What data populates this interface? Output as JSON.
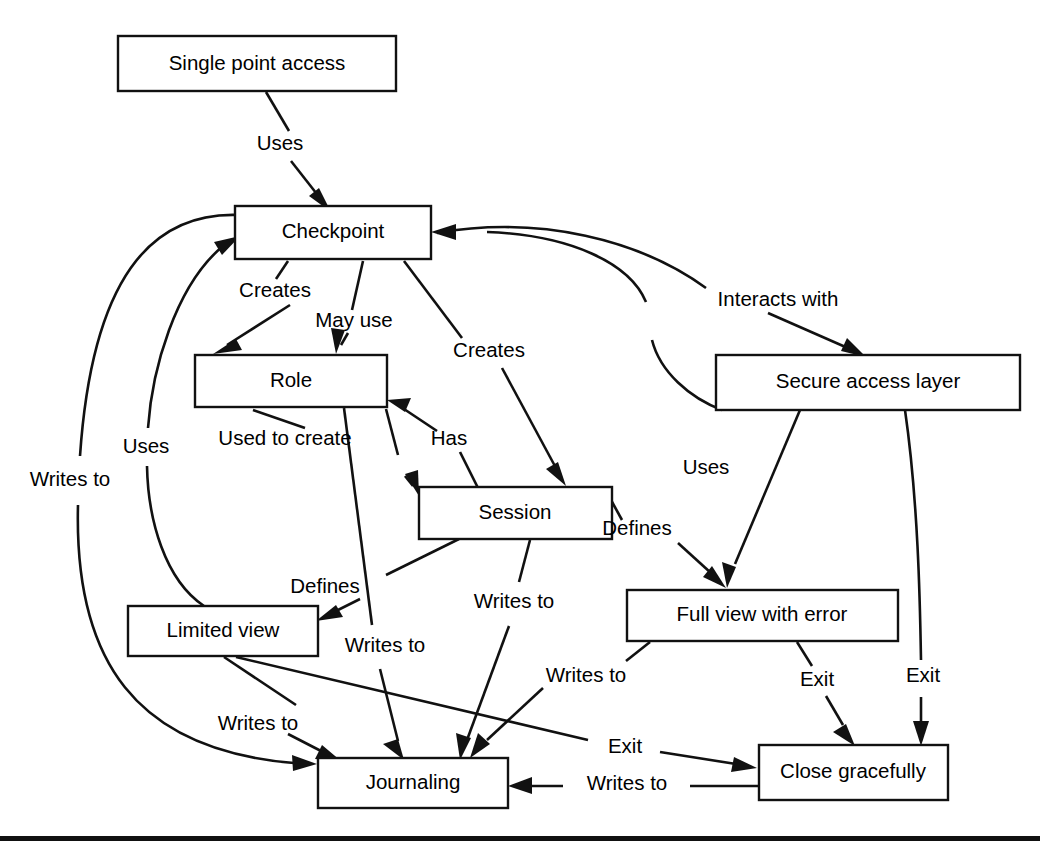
{
  "diagram": {
    "type": "node-edge-diagram",
    "stroke_color": "#111111",
    "node_fill": "#ffffff",
    "background": "#ffffff",
    "nodes": [
      {
        "id": "single_point_access",
        "label": "Single point access",
        "x": 118,
        "y": 36,
        "w": 278,
        "h": 55
      },
      {
        "id": "checkpoint",
        "label": "Checkpoint",
        "x": 235,
        "y": 206,
        "w": 196,
        "h": 53
      },
      {
        "id": "role",
        "label": "Role",
        "x": 195,
        "y": 355,
        "w": 192,
        "h": 52
      },
      {
        "id": "secure_access_layer",
        "label": "Secure access layer",
        "x": 716,
        "y": 355,
        "w": 304,
        "h": 55
      },
      {
        "id": "session",
        "label": "Session",
        "x": 419,
        "y": 487,
        "w": 193,
        "h": 52
      },
      {
        "id": "limited_view",
        "label": "Limited view",
        "x": 128,
        "y": 606,
        "w": 190,
        "h": 50
      },
      {
        "id": "full_view_error",
        "label": "Full view with error",
        "x": 627,
        "y": 590,
        "w": 271,
        "h": 51
      },
      {
        "id": "journaling",
        "label": "Journaling",
        "x": 318,
        "y": 758,
        "w": 190,
        "h": 50
      },
      {
        "id": "close_gracefully",
        "label": "Close gracefully",
        "x": 759,
        "y": 745,
        "w": 189,
        "h": 55
      }
    ],
    "edges": [
      {
        "id": "e1",
        "from": "single_point_access",
        "to": "checkpoint",
        "label": "Uses",
        "label_x": 280,
        "label_y": 145,
        "label_anchor": "middle"
      },
      {
        "id": "e2",
        "from": "checkpoint",
        "to": "role",
        "label": "Creates",
        "label_x": 275,
        "label_y": 292,
        "label_anchor": "middle"
      },
      {
        "id": "e3",
        "from": "checkpoint",
        "to": "role",
        "label": "May use",
        "label_x": 354,
        "label_y": 322,
        "label_anchor": "middle"
      },
      {
        "id": "e4",
        "from": "checkpoint",
        "to": "session",
        "label": "Creates",
        "label_x": 489,
        "label_y": 352,
        "label_anchor": "middle"
      },
      {
        "id": "e5",
        "from": "checkpoint",
        "to": "secure_access_layer",
        "label": "Interacts with",
        "label_x": 778,
        "label_y": 301,
        "label_anchor": "middle"
      },
      {
        "id": "e6",
        "from": "role",
        "to": "session",
        "label": "Used to create",
        "label_x": 285,
        "label_y": 440,
        "label_anchor": "middle"
      },
      {
        "id": "e7",
        "from": "session",
        "to": "role",
        "label": "Has",
        "label_x": 449,
        "label_y": 440,
        "label_anchor": "middle"
      },
      {
        "id": "e8",
        "from": "session",
        "to": "full_view_error",
        "label": "Defines",
        "label_x": 637,
        "label_y": 530,
        "label_anchor": "middle"
      },
      {
        "id": "e9",
        "from": "session",
        "to": "limited_view",
        "label": "Defines",
        "label_x": 325,
        "label_y": 588,
        "label_anchor": "middle"
      },
      {
        "id": "e10",
        "from": "secure_access_layer",
        "to": "checkpoint",
        "label": "Uses",
        "label_x": 706,
        "label_y": 469,
        "label_anchor": "middle"
      },
      {
        "id": "e11",
        "from": "secure_access_layer",
        "to": "full_view_error",
        "label": "",
        "label_x": 0,
        "label_y": 0,
        "label_anchor": "middle"
      },
      {
        "id": "e12",
        "from": "role",
        "to": "journaling",
        "label": "Writes to",
        "label_x": 385,
        "label_y": 647,
        "label_anchor": "middle"
      },
      {
        "id": "e13",
        "from": "session",
        "to": "journaling",
        "label": "Writes to",
        "label_x": 514,
        "label_y": 603,
        "label_anchor": "middle"
      },
      {
        "id": "e14",
        "from": "limited_view",
        "to": "journaling",
        "label": "Writes to",
        "label_x": 258,
        "label_y": 725,
        "label_anchor": "middle"
      },
      {
        "id": "e15",
        "from": "full_view_error",
        "to": "journaling",
        "label": "Writes to",
        "label_x": 586,
        "label_y": 677,
        "label_anchor": "middle"
      },
      {
        "id": "e16",
        "from": "checkpoint",
        "to": "journaling",
        "label": "Writes to",
        "label_x": 70,
        "label_y": 481,
        "label_anchor": "middle"
      },
      {
        "id": "e17",
        "from": "limited_view",
        "to": "checkpoint",
        "label": "Uses",
        "label_x": 146,
        "label_y": 448,
        "label_anchor": "middle"
      },
      {
        "id": "e18",
        "from": "full_view_error",
        "to": "close_gracefully",
        "label": "Exit",
        "label_x": 817,
        "label_y": 681,
        "label_anchor": "middle"
      },
      {
        "id": "e19",
        "from": "secure_access_layer",
        "to": "close_gracefully",
        "label": "Exit",
        "label_x": 923,
        "label_y": 677,
        "label_anchor": "middle"
      },
      {
        "id": "e20",
        "from": "limited_view",
        "to": "close_gracefully",
        "label": "Exit",
        "label_x": 625,
        "label_y": 748,
        "label_anchor": "middle"
      },
      {
        "id": "e21",
        "from": "close_gracefully",
        "to": "journaling",
        "label": "Writes to",
        "label_x": 627,
        "label_y": 785,
        "label_anchor": "middle"
      }
    ],
    "footer_rule": {
      "x": 0,
      "y": 836,
      "w": 1040,
      "h": 5
    }
  }
}
